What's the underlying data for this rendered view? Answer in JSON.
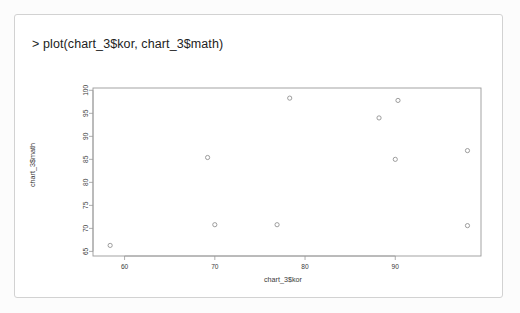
{
  "console": {
    "prompt": ">",
    "command": "> plot(chart_3$kor, chart_3$math)"
  },
  "chart_data": {
    "type": "scatter",
    "title": "",
    "xlabel": "chart_3$kor",
    "ylabel": "chart_3$math",
    "xlim": [
      56.5,
      99.5
    ],
    "ylim": [
      64.0,
      100.5
    ],
    "xticks": [
      60,
      70,
      80,
      90
    ],
    "yticks": [
      65,
      70,
      75,
      80,
      85,
      90,
      95,
      100
    ],
    "xticklabels": [
      "60",
      "70",
      "80",
      "90"
    ],
    "yticklabels": [
      "65",
      "70",
      "75",
      "80",
      "85",
      "90",
      "95",
      "100"
    ],
    "grid": false,
    "legend": null,
    "marker": "open-circle",
    "marker_color": "#8d8d8d",
    "x": [
      58.4,
      69.2,
      70.0,
      76.9,
      78.3,
      88.2,
      90.0,
      90.3,
      98.0,
      98.0
    ],
    "y": [
      66.3,
      85.4,
      70.8,
      70.8,
      98.3,
      94.0,
      85.0,
      97.8,
      86.9,
      70.6
    ],
    "points": [
      {
        "x": 58.4,
        "y": 66.3
      },
      {
        "x": 69.2,
        "y": 85.4
      },
      {
        "x": 70.0,
        "y": 70.8
      },
      {
        "x": 76.9,
        "y": 70.8
      },
      {
        "x": 78.3,
        "y": 98.3
      },
      {
        "x": 88.2,
        "y": 94.0
      },
      {
        "x": 90.0,
        "y": 85.0
      },
      {
        "x": 90.3,
        "y": 97.8
      },
      {
        "x": 98.0,
        "y": 86.9
      },
      {
        "x": 98.0,
        "y": 70.6
      }
    ]
  },
  "colors": {
    "panel_border": "#d2d2d2",
    "axis": "#9a9a9a",
    "text": "#3a3a3a",
    "marker": "#8d8d8d",
    "background": "#ffffff"
  }
}
